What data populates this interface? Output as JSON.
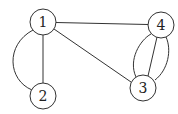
{
  "diagram": {
    "type": "multigraph",
    "colors": {
      "stroke": "#333333",
      "node_fill": "#ffffff",
      "text": "#222222",
      "background": "#ffffff"
    },
    "node_radius": 13,
    "nodes": [
      {
        "id": "1",
        "label": "1",
        "x": 43,
        "y": 22
      },
      {
        "id": "2",
        "label": "2",
        "x": 43,
        "y": 96
      },
      {
        "id": "3",
        "label": "3",
        "x": 143,
        "y": 88
      },
      {
        "id": "4",
        "label": "4",
        "x": 161,
        "y": 25
      }
    ],
    "edges": [
      {
        "from": "1",
        "to": "4",
        "shape": "straight"
      },
      {
        "from": "1",
        "to": "3",
        "shape": "straight"
      },
      {
        "from": "1",
        "to": "2",
        "shape": "straight"
      },
      {
        "from": "1",
        "to": "2",
        "shape": "arc-left"
      },
      {
        "from": "3",
        "to": "4",
        "shape": "straight"
      },
      {
        "from": "3",
        "to": "4",
        "shape": "arc-left"
      },
      {
        "from": "3",
        "to": "4",
        "shape": "arc-right"
      }
    ]
  }
}
